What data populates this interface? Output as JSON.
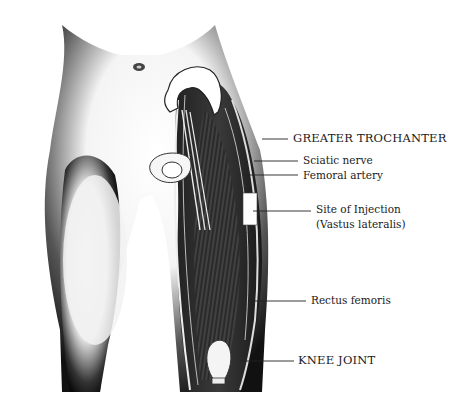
{
  "diagram": {
    "labels": [
      {
        "id": "greater-trochanter",
        "text": "GREATER TROCHANTER",
        "x": 293,
        "y": 132,
        "line": [
          262,
          139,
          288,
          139
        ],
        "style": "caps"
      },
      {
        "id": "sciatic-nerve",
        "text": "Sciatic nerve",
        "x": 303,
        "y": 155,
        "line": [
          254,
          161,
          298,
          161
        ],
        "style": "small"
      },
      {
        "id": "femoral-artery",
        "text": "Femoral artery",
        "x": 303,
        "y": 171,
        "line": [
          245,
          175,
          298,
          175
        ],
        "style": "small"
      },
      {
        "id": "site-of-injection",
        "text": "Site of Injection",
        "x": 316,
        "y": 203,
        "line": [
          255,
          211,
          311,
          211
        ],
        "style": "small"
      },
      {
        "id": "vastus-lateralis",
        "text": "(Vastus lateralis)",
        "x": 316,
        "y": 218,
        "line": null,
        "style": "small"
      },
      {
        "id": "rectus-femoris",
        "text": "Rectus femoris",
        "x": 311,
        "y": 295,
        "line": [
          254,
          301,
          306,
          301
        ],
        "style": "small"
      },
      {
        "id": "knee-joint",
        "text": "KNEE JOINT",
        "x": 298,
        "y": 355,
        "line": [
          240,
          361,
          294,
          361
        ],
        "style": "caps"
      }
    ]
  }
}
